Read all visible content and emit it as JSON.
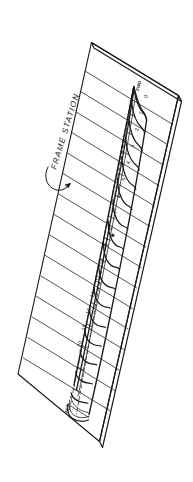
{
  "figure": {
    "kind": "technical-line-drawing",
    "background_color": "#ffffff",
    "ink_color": "#1a1a1a"
  },
  "callout": {
    "label": "FRAME STATION",
    "leader": "curved-arrow"
  },
  "annotations": {
    "bow_label": "FWD",
    "stern_label": "AFT",
    "midship_marker": "✱"
  },
  "stations": {
    "header": "Frame station numbers",
    "labels": [
      "0",
      "1",
      "2",
      "3",
      "4",
      "5",
      "6",
      "7",
      "8",
      "9",
      "10",
      "12",
      "14",
      "16",
      "18",
      "20"
    ]
  },
  "station_marks": [
    {
      "label": "0",
      "x": 147.5,
      "y": 97.0
    },
    {
      "label": "1",
      "x": 143.0,
      "y": 113.5
    },
    {
      "label": "2",
      "x": 138.6,
      "y": 130.0
    },
    {
      "label": "3",
      "x": 134.2,
      "y": 146.5
    },
    {
      "label": "4",
      "x": 129.8,
      "y": 163.0
    },
    {
      "label": "5",
      "x": 125.4,
      "y": 179.5
    },
    {
      "label": "6",
      "x": 121.0,
      "y": 196.0
    },
    {
      "label": "7",
      "x": 116.6,
      "y": 212.5
    },
    {
      "label": "8",
      "x": 112.2,
      "y": 229.0
    },
    {
      "label": "9",
      "x": 107.8,
      "y": 245.5
    },
    {
      "label": "10",
      "x": 103.4,
      "y": 262.0
    },
    {
      "label": "12",
      "x": 99.0,
      "y": 278.5
    },
    {
      "label": "14",
      "x": 94.6,
      "y": 295.0
    },
    {
      "label": "16",
      "x": 90.2,
      "y": 311.5
    },
    {
      "label": "18",
      "x": 85.8,
      "y": 328.0
    },
    {
      "label": "20",
      "x": 81.4,
      "y": 344.5
    }
  ]
}
